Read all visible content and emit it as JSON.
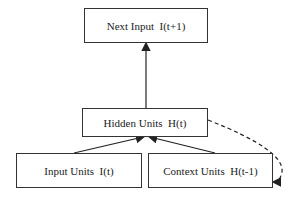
{
  "nodes": {
    "next_input": "Next Input  I(t+1)",
    "hidden": "Hidden Units  H(t)",
    "input": "Input Units  I(t)",
    "context": "Context Units  H(t-1)"
  },
  "edges": [
    {
      "from": "hidden",
      "to": "next_input",
      "style": "solid"
    },
    {
      "from": "input",
      "to": "hidden",
      "style": "solid"
    },
    {
      "from": "context",
      "to": "hidden",
      "style": "solid"
    },
    {
      "from": "hidden",
      "to": "context",
      "style": "dashed"
    }
  ]
}
